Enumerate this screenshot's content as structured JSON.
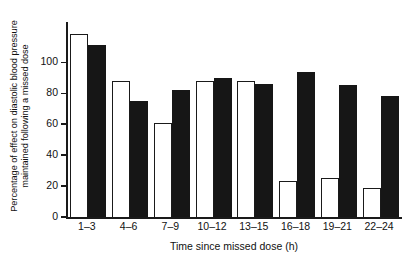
{
  "chart_data": {
    "type": "bar",
    "title": "",
    "xlabel": "Time since missed dose (h)",
    "ylabel_line1": "Percentage of effect on diastolic blood pressure",
    "ylabel_line2": "maintained following a missed dose",
    "categories": [
      "1–3",
      "4–6",
      "7–9",
      "10–12",
      "13–15",
      "16–18",
      "19–21",
      "22–24"
    ],
    "series": [
      {
        "name": "open",
        "fill": "#ffffff",
        "edge": "#1a1a1a",
        "values": [
          118,
          88,
          61,
          88,
          88,
          23,
          25,
          19
        ]
      },
      {
        "name": "filled",
        "fill": "#161616",
        "edge": "#161616",
        "values": [
          111,
          75,
          82,
          90,
          86,
          94,
          85,
          78
        ]
      }
    ],
    "ylim": [
      0,
      126
    ],
    "yticks": [
      0,
      20,
      40,
      60,
      80,
      100
    ],
    "ytick_labels": [
      "0",
      "20",
      "40",
      "60",
      "80",
      "100"
    ],
    "grid": false,
    "legend": "none",
    "axis_color": "#1a1a1a",
    "background": "#ffffff"
  }
}
